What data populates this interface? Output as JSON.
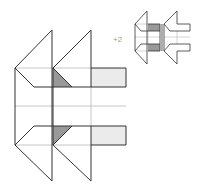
{
  "diagram": {
    "type": "geometric-figure-puzzle",
    "annotation": "+2",
    "colors": {
      "line": "#333333",
      "thin_line": "#b8b8b8",
      "dark_fill": "#999999",
      "light_fill": "#ebebeb",
      "label": "#9a9a9a"
    },
    "main_figure": {
      "description": "Two overlapping arrow/chevron shapes pointing left with a rectangular body",
      "dark_triangles": 2,
      "light_rectangles": 2
    },
    "small_figures": [
      {
        "id": "option-1",
        "has_dark_fill": true
      },
      {
        "id": "option-2",
        "has_dark_fill": false
      }
    ]
  }
}
